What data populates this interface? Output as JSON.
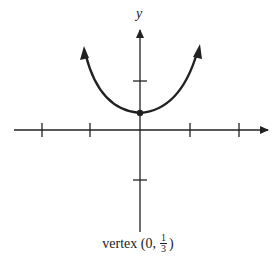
{
  "axes": {
    "x_label": "x",
    "y_label": "y"
  },
  "caption": {
    "prefix": "vertex (0,",
    "numerator": "1",
    "denominator": "3",
    "suffix": ")"
  },
  "colors": {
    "ink": "#222222",
    "background": "#ffffff"
  },
  "curve": {
    "type": "parabola",
    "vertex": [
      0,
      0.3333
    ],
    "opens": "up"
  },
  "ticks": {
    "x": [
      -2,
      -1,
      1,
      2
    ],
    "y": [
      -1,
      1
    ]
  }
}
